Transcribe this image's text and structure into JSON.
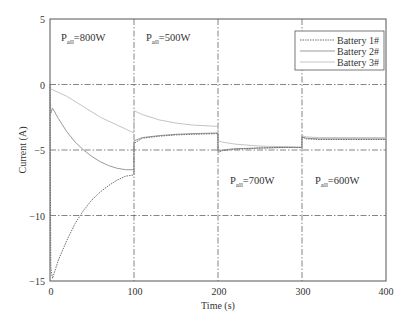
{
  "chart_data": {
    "type": "line",
    "title": "",
    "xlabel": "Time (s)",
    "ylabel": "Current (A)",
    "xlim": [
      0,
      400
    ],
    "ylim": [
      -15,
      5
    ],
    "xticks": [
      0,
      100,
      200,
      300,
      400
    ],
    "yticks": [
      5,
      0,
      -5,
      -10,
      -15
    ],
    "xtick_labels": [
      "0",
      "100",
      "200",
      "300",
      "400"
    ],
    "ytick_labels": [
      "5",
      "0",
      "−5",
      "−10",
      "−15"
    ],
    "grid": {
      "on": true,
      "style": "dash-dot",
      "x_lines": [
        100,
        200,
        300
      ],
      "y_lines": [
        0,
        -5,
        -10
      ]
    },
    "legend": {
      "position": "upper right",
      "entries": [
        "Battery 1#",
        "Battery 2#",
        "Battery 3#"
      ]
    },
    "annotations": [
      {
        "text": "P",
        "sub": "all",
        "suffix": " = 800W",
        "x": 10,
        "y": 3.6
      },
      {
        "text": "P",
        "sub": "all",
        "suffix": " = 500W",
        "x": 110,
        "y": 3.6
      },
      {
        "text": "P",
        "sub": "all",
        "suffix": " = 700W",
        "x": 215,
        "y": -8.8
      },
      {
        "text": "P",
        "sub": "all",
        "suffix": " = 600W",
        "x": 315,
        "y": -8.8
      }
    ],
    "series": [
      {
        "name": "Battery 1#",
        "color": "#6f6f6f",
        "dash": "1.5,1",
        "x": [
          0,
          1,
          3,
          10,
          20,
          30,
          40,
          50,
          60,
          70,
          80,
          90,
          99.9,
          100,
          110,
          130,
          150,
          170,
          199.9,
          200,
          205,
          220,
          250,
          280,
          299.9,
          300,
          305,
          320,
          350,
          400
        ],
        "y": [
          0,
          -14.0,
          -14.8,
          -13.4,
          -11.9,
          -10.6,
          -9.6,
          -8.8,
          -8.2,
          -7.7,
          -7.3,
          -7.0,
          -6.9,
          -4.5,
          -4.1,
          -3.95,
          -3.85,
          -3.8,
          -3.75,
          -5.2,
          -5.05,
          -4.95,
          -4.85,
          -4.8,
          -4.8,
          -4.0,
          -4.15,
          -4.2,
          -4.2,
          -4.2
        ]
      },
      {
        "name": "Battery 2#",
        "color": "#9a9a9a",
        "dash": "",
        "x": [
          0,
          1,
          3,
          10,
          20,
          30,
          40,
          50,
          60,
          70,
          80,
          90,
          99.9,
          100,
          110,
          130,
          150,
          170,
          199.9,
          200,
          205,
          220,
          250,
          280,
          299.9,
          300,
          305,
          320,
          350,
          400
        ],
        "y": [
          0,
          -2.2,
          -1.8,
          -2.6,
          -3.6,
          -4.4,
          -5.0,
          -5.5,
          -5.9,
          -6.2,
          -6.4,
          -6.5,
          -6.5,
          -4.3,
          -4.05,
          -3.9,
          -3.8,
          -3.75,
          -3.7,
          -5.1,
          -5.0,
          -4.9,
          -4.85,
          -4.8,
          -4.8,
          -4.0,
          -4.1,
          -4.15,
          -4.15,
          -4.15
        ]
      },
      {
        "name": "Battery 3#",
        "color": "#c4c4c4",
        "dash": "",
        "x": [
          0,
          3,
          10,
          20,
          30,
          40,
          50,
          60,
          70,
          80,
          90,
          99.9,
          100,
          110,
          130,
          150,
          170,
          199.9,
          200,
          205,
          220,
          250,
          280,
          299.9,
          300,
          305,
          320,
          350,
          400
        ],
        "y": [
          -0.3,
          -0.4,
          -0.6,
          -0.9,
          -1.3,
          -1.7,
          -2.1,
          -2.5,
          -2.8,
          -3.1,
          -3.4,
          -3.7,
          -2.0,
          -2.3,
          -2.7,
          -2.95,
          -3.1,
          -3.2,
          -4.3,
          -4.4,
          -4.55,
          -4.7,
          -4.75,
          -4.8,
          -3.9,
          -4.0,
          -4.05,
          -4.05,
          -4.05
        ]
      }
    ]
  },
  "labels": {
    "xlabel": "Time (s)",
    "ylabel": "Current (A)",
    "legend": [
      "Battery 1#",
      "Battery 2#",
      "Battery 3#"
    ],
    "annotations": [
      {
        "p": "P",
        "sub": "all",
        "value": "=800W"
      },
      {
        "p": "P",
        "sub": "all",
        "value": "=500W"
      },
      {
        "p": "P",
        "sub": "all",
        "value": "=700W"
      },
      {
        "p": "P",
        "sub": "all",
        "value": "=600W"
      }
    ],
    "xticks": [
      "0",
      "100",
      "200",
      "300",
      "400"
    ],
    "yticks": [
      "5",
      "0",
      "−5",
      "−10",
      "−15"
    ]
  }
}
